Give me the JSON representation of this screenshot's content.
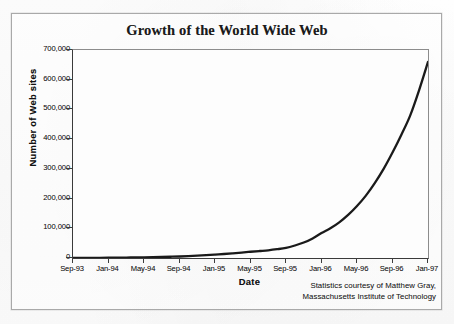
{
  "figure": {
    "title": "Growth of the World Wide Web",
    "attribution_line1": "Statistics courtesy of Matthew Gray,",
    "attribution_line2": "Massachusetts Institute of Technology"
  },
  "bleed_through": {
    "line1": "and the most widely used of all Internet",
    "line2": "services. The World Wide Web has grown",
    "line3": "from a handful of servers to over several",
    "line4": "hundred thousand in only a few years.",
    "line5": "The rapid growth shows no sign of",
    "line6": "slowing as more businesses and",
    "line7": "individuals connect to the Internet."
  },
  "chart_data": {
    "type": "line",
    "title": "Growth of the World Wide Web",
    "xlabel": "Date",
    "ylabel": "Number of Web sites",
    "grid": false,
    "legend": false,
    "ylim": [
      0,
      700000
    ],
    "ytick_labels": [
      "700,000",
      "600,000",
      "500,000",
      "400,000",
      "300,000",
      "200,000",
      "100,000",
      "0"
    ],
    "ytick_values": [
      700000,
      600000,
      500000,
      400000,
      300000,
      200000,
      100000,
      0
    ],
    "xtick_labels": [
      "Sep-93",
      "Jan-94",
      "May-94",
      "Sep-94",
      "Jan-95",
      "May-95",
      "Sep-95",
      "Jan-96",
      "May-96",
      "Sep-96",
      "Jan-97"
    ],
    "x": [
      "Sep-93",
      "Oct-93",
      "Nov-93",
      "Dec-93",
      "Jan-94",
      "Feb-94",
      "Mar-94",
      "Apr-94",
      "May-94",
      "Jun-94",
      "Jul-94",
      "Aug-94",
      "Sep-94",
      "Oct-94",
      "Nov-94",
      "Dec-94",
      "Jan-95",
      "Feb-95",
      "Mar-95",
      "Apr-95",
      "May-95",
      "Jun-95",
      "Jul-95",
      "Aug-95",
      "Sep-95",
      "Oct-95",
      "Nov-95",
      "Dec-95",
      "Jan-96",
      "Feb-96",
      "Mar-96",
      "Apr-96",
      "May-96",
      "Jun-96",
      "Jul-96",
      "Aug-96",
      "Sep-96",
      "Oct-96",
      "Nov-96",
      "Dec-96",
      "Jan-97"
    ],
    "values": [
      200,
      280,
      400,
      560,
      800,
      1100,
      1500,
      1900,
      2400,
      2900,
      3500,
      4200,
      5000,
      6300,
      7800,
      9500,
      11500,
      13500,
      15800,
      18200,
      21000,
      23500,
      26000,
      29500,
      34000,
      42000,
      52000,
      66000,
      84000,
      100000,
      120000,
      145000,
      175000,
      210000,
      252000,
      300000,
      355000,
      415000,
      480000,
      565000,
      660000
    ],
    "series": [
      {
        "name": "Number of Web sites",
        "color": "#1a1a1a",
        "line_width": 2.3,
        "values": [
          200,
          280,
          400,
          560,
          800,
          1100,
          1500,
          1900,
          2400,
          2900,
          3500,
          4200,
          5000,
          6300,
          7800,
          9500,
          11500,
          13500,
          15800,
          18200,
          21000,
          23500,
          26000,
          29500,
          34000,
          42000,
          52000,
          66000,
          84000,
          100000,
          120000,
          145000,
          175000,
          210000,
          252000,
          300000,
          355000,
          415000,
          480000,
          565000,
          660000
        ]
      }
    ],
    "annotations": [
      "Statistics courtesy of Matthew Gray,",
      "Massachusetts Institute of Technology"
    ]
  },
  "colors": {
    "line": "#1a1a1a",
    "axis": "#3d3d3d",
    "plot_background": "#fdfdfd",
    "page_background": "#fdfdfd",
    "frame": "#a9a9a9",
    "text": "#1d1d1d"
  }
}
